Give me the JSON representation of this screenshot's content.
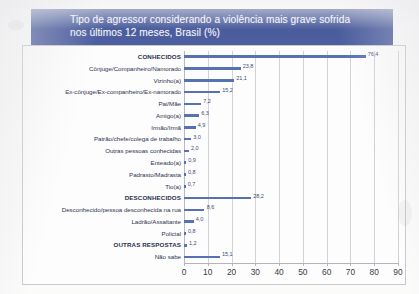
{
  "title": {
    "line1": "Tipo de agressor considerando a violência mais grave sofrida",
    "line2": "nos últimos 12 meses, Brasil (%)"
  },
  "colors": {
    "banner": "#4d5fa0",
    "bar": "#5871b4",
    "value_label": "#3f4a7a",
    "gridline": "#d2d2d8",
    "frame": "#c9c9cd"
  },
  "chart_data": {
    "type": "bar",
    "orientation": "horizontal",
    "title": "Tipo de agressor considerando a violência mais grave sofrida nos últimos 12 meses, Brasil (%)",
    "xlabel": "",
    "ylabel": "",
    "xlim": [
      0,
      90
    ],
    "xticks": [
      "0",
      "10",
      "20",
      "30",
      "40",
      "50",
      "60",
      "70",
      "80",
      "90"
    ],
    "grid": true,
    "legend": false,
    "value_label_format": "comma-decimal",
    "categories": [
      "CONHECIDOS",
      "Cônjuge/Companheiro/Namorado",
      "Vizinho(a)",
      "Ex-cônjuge/Ex-companheiro/Ex-namorado",
      "Pai/Mãe",
      "Amigo(a)",
      "Irmão/Irmã",
      "Patrão/chefe/colega de trabalho",
      "Outras pessoas conhecidas",
      "Enteado(a)",
      "Padrasto/Madrasta",
      "Tio(a)",
      "DESCONHECIDOS",
      "Desconhecido/pessoa desconhecida na rua",
      "Ladrão/Assaltante",
      "Policial",
      "OUTRAS RESPOSTAS",
      "Não sabe"
    ],
    "values": [
      76.4,
      23.8,
      21.1,
      15.2,
      7.2,
      6.3,
      4.9,
      3.0,
      2.0,
      0.9,
      0.8,
      0.7,
      28.2,
      8.6,
      4.0,
      0.8,
      1.2,
      15.1
    ],
    "value_labels": [
      "76,4",
      "23,8",
      "21,1",
      "15,2",
      "7,2",
      "6,3",
      "4,9",
      "3,0",
      "2,0",
      "0,9",
      "0,8",
      "0,7",
      "28,2",
      "8,6",
      "4,0",
      "0,8",
      "1,2",
      "15,1"
    ],
    "group_headers": [
      "CONHECIDOS",
      "DESCONHECIDOS",
      "OUTRAS RESPOSTAS"
    ]
  }
}
